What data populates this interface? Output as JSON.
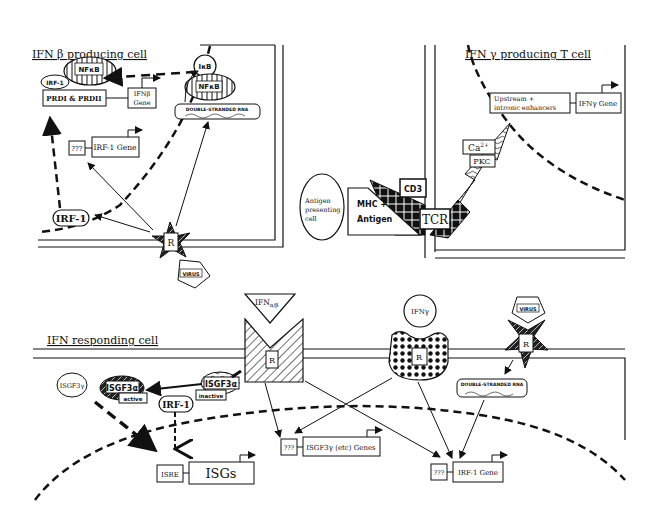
{
  "diagram": {
    "panels": {
      "ifn_beta_cell": {
        "title": "IFN β  producing cell"
      },
      "ifn_gamma_cell": {
        "title": "IFN γ  producing T cell"
      },
      "responding_cell": {
        "title": "IFN  responding cell"
      }
    },
    "ifn_beta_cell": {
      "irf1_small": "IRF-1",
      "nfkb_nucleus": "NFκB",
      "prdi": "PRDI & PRDII",
      "ifnb_gene_line1": "IFNβ",
      "ifnb_gene_line2": "Gene",
      "ikb": "IκB",
      "nfkb_cyto": "NFκB",
      "dsrna": "DOUBLE-STRANDED RNA",
      "unknown": "???",
      "irf1_gene": "IRF-1 Gene",
      "irf1_protein": "IRF-1",
      "receptor": "R",
      "virus": "VIRUS"
    },
    "ifn_gamma_cell": {
      "enhancers_line1": "Upstream +",
      "enhancers_line2": "intronic enhancers",
      "ifng_gene": "IFNγ Gene",
      "ca": "Ca",
      "ca_sup": "2+",
      "pkc": "PKC",
      "cd3": "CD3",
      "tcr": "TCR",
      "mhc_line1": "MHC +",
      "mhc_line2": "Antigen",
      "apc_line1": "Antigen",
      "apc_line2": "presenting",
      "apc_line3": "cell"
    },
    "responding_cell": {
      "ifn_ab": "IFN",
      "ifn_ab_sub": "α/β",
      "receptor_ab": "R",
      "ifn_g": "IFNγ",
      "receptor_g": "R",
      "virus": "VIRUS",
      "receptor_v": "R",
      "dsrna": "DOUBLE-STRANDED RNA",
      "isgf3g": "ISGF3γ",
      "isgf3a_active": "ISGF3α",
      "active": "active",
      "isgf3a_inactive": "ISGF3α",
      "inactive": "inactive",
      "irf1": "IRF-1",
      "isre": "ISRE",
      "isgs": "ISGs",
      "unknown1": "???",
      "isgf3g_genes": "ISGF3γ (etc) Genes",
      "unknown2": "???",
      "irf1_gene": "IRF-1 Gene"
    }
  }
}
